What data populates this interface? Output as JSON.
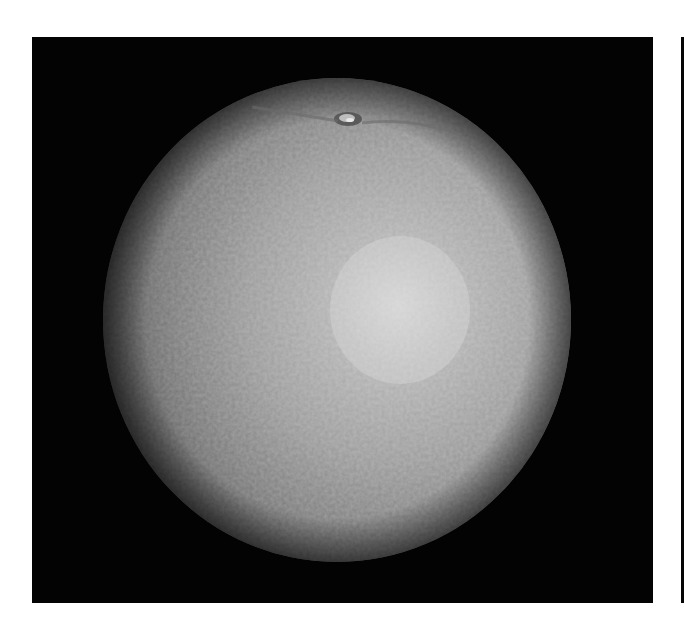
{
  "image": {
    "subject": "orange",
    "description": "Grayscale photograph of a single orange with a textured, dimpled peel on a black background; stem end visible at top, specular highlight right of center",
    "colors": {
      "page_background": "#ffffff",
      "photo_background": "#030303",
      "peel_shadow": "#3a3a3a",
      "peel_mid": "#8a8a8a",
      "peel_highlight": "#c8c8c8",
      "right_strip": "#050505"
    },
    "frame": {
      "x": 32,
      "y": 37,
      "width": 621,
      "height": 566
    },
    "fruit": {
      "cx": 337,
      "cy": 320,
      "rx": 234,
      "ry": 242
    },
    "stem": {
      "x": 348,
      "y": 118
    },
    "highlight": {
      "x": 400,
      "y": 310
    }
  }
}
